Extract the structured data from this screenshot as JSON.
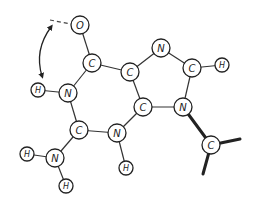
{
  "diagram": {
    "title": "",
    "atoms": [
      {
        "id": "O1",
        "label": "O",
        "x": 80,
        "y": 25,
        "r": 9
      },
      {
        "id": "C6",
        "label": "C",
        "x": 92,
        "y": 63,
        "r": 9
      },
      {
        "id": "C5",
        "label": "C",
        "x": 130,
        "y": 72,
        "r": 9
      },
      {
        "id": "N7",
        "label": "N",
        "x": 161,
        "y": 48,
        "r": 9
      },
      {
        "id": "C8",
        "label": "C",
        "x": 192,
        "y": 68,
        "r": 9
      },
      {
        "id": "H8",
        "label": "H",
        "x": 222,
        "y": 65,
        "r": 7
      },
      {
        "id": "N9",
        "label": "N",
        "x": 183,
        "y": 107,
        "r": 9
      },
      {
        "id": "C4",
        "label": "C",
        "x": 143,
        "y": 107,
        "r": 9
      },
      {
        "id": "N1",
        "label": "N",
        "x": 68,
        "y": 93,
        "r": 9
      },
      {
        "id": "H1",
        "label": "H",
        "x": 38,
        "y": 90,
        "r": 7
      },
      {
        "id": "C2",
        "label": "C",
        "x": 79,
        "y": 130,
        "r": 9
      },
      {
        "id": "N3",
        "label": "N",
        "x": 117,
        "y": 133,
        "r": 9
      },
      {
        "id": "H3",
        "label": "H",
        "x": 126,
        "y": 168,
        "r": 7
      },
      {
        "id": "N2",
        "label": "N",
        "x": 55,
        "y": 158,
        "r": 9
      },
      {
        "id": "H2a",
        "label": "H",
        "x": 27,
        "y": 154,
        "r": 7
      },
      {
        "id": "H2b",
        "label": "H",
        "x": 66,
        "y": 186,
        "r": 7
      },
      {
        "id": "C1p",
        "label": "C",
        "x": 211,
        "y": 145,
        "r": 9
      }
    ],
    "bonds": [
      {
        "from": "O1",
        "to": "C6",
        "style": "normal"
      },
      {
        "from": "C6",
        "to": "C5",
        "style": "normal"
      },
      {
        "from": "C6",
        "to": "N1",
        "style": "normal"
      },
      {
        "from": "C5",
        "to": "N7",
        "style": "normal"
      },
      {
        "from": "C5",
        "to": "C4",
        "style": "normal"
      },
      {
        "from": "N7",
        "to": "C8",
        "style": "normal"
      },
      {
        "from": "C8",
        "to": "H8",
        "style": "normal"
      },
      {
        "from": "C8",
        "to": "N9",
        "style": "normal"
      },
      {
        "from": "N9",
        "to": "C4",
        "style": "normal"
      },
      {
        "from": "C4",
        "to": "N3",
        "style": "normal"
      },
      {
        "from": "N1",
        "to": "H1",
        "style": "normal"
      },
      {
        "from": "N1",
        "to": "C2",
        "style": "normal"
      },
      {
        "from": "C2",
        "to": "N3",
        "style": "normal"
      },
      {
        "from": "C2",
        "to": "N2",
        "style": "normal"
      },
      {
        "from": "N3",
        "to": "H3",
        "style": "normal"
      },
      {
        "from": "N2",
        "to": "H2a",
        "style": "normal"
      },
      {
        "from": "N2",
        "to": "H2b",
        "style": "normal"
      },
      {
        "from": "N9",
        "to": "C1p",
        "style": "bold"
      }
    ],
    "stub_bonds": [
      {
        "from": "C1p",
        "x2": 240,
        "y2": 139,
        "style": "bold"
      },
      {
        "from": "C1p",
        "x2": 203,
        "y2": 174,
        "style": "bold"
      }
    ],
    "annotations": {
      "hbond_dashed": {
        "x1": 50,
        "y1": 20,
        "x2": 71,
        "y2": 24
      },
      "tautomer_arrow": {
        "start": [
          51,
          27
        ],
        "control": [
          34,
          50
        ],
        "end": [
          42,
          76
        ]
      }
    },
    "colors": {
      "stroke": "#222222",
      "background": "#ffffff"
    }
  }
}
